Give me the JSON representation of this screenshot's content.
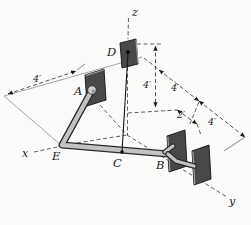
{
  "figure": {
    "background_color": "#fbfbf9",
    "ink_color": "#1c1c1c",
    "plate_color": "#484848",
    "member_color": "#c3c3c3",
    "axes": {
      "x_label": "x",
      "y_label": "y",
      "z_label": "z"
    },
    "points": {
      "A": "A",
      "B": "B",
      "C": "C",
      "D": "D",
      "E": "E"
    },
    "dimensions": {
      "ground_left": "4′",
      "height_d": "4′",
      "back_upper": "4′",
      "back_lower": "4′",
      "plate_offset": "2′"
    }
  }
}
